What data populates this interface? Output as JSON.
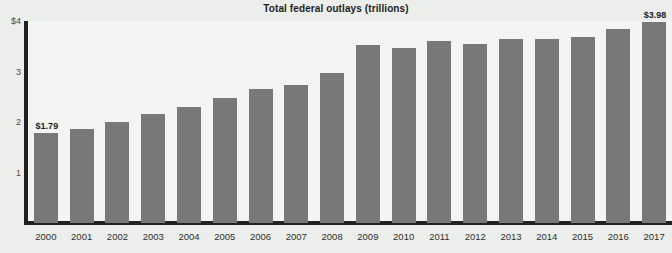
{
  "chart_data": {
    "type": "bar",
    "title": "Total federal outlays (trillions)",
    "xlabel": "",
    "ylabel": "",
    "ylim": [
      0,
      4
    ],
    "grid": false,
    "legend": "none",
    "y_ticks": [
      "$4",
      "3",
      "2",
      "1"
    ],
    "y_tick_values": [
      4,
      3,
      2,
      1
    ],
    "categories": [
      "2000",
      "2001",
      "2002",
      "2003",
      "2004",
      "2005",
      "2006",
      "2007",
      "2008",
      "2009",
      "2010",
      "2011",
      "2012",
      "2013",
      "2014",
      "2015",
      "2016",
      "2017"
    ],
    "values": [
      1.79,
      1.86,
      2.01,
      2.16,
      2.29,
      2.47,
      2.66,
      2.73,
      2.98,
      3.52,
      3.46,
      3.6,
      3.54,
      3.65,
      3.65,
      3.69,
      3.85,
      3.98
    ],
    "annotations": [
      {
        "category": "2000",
        "text": "$1.79"
      },
      {
        "category": "2017",
        "text": "$3.98"
      }
    ],
    "colors": {
      "bar": "#787877",
      "axis": "#22211f",
      "plot_background": "#f4f4f2",
      "page_background": "#eceeec",
      "text": "#1d1d1d",
      "tick_text": "#4b4b49"
    }
  }
}
